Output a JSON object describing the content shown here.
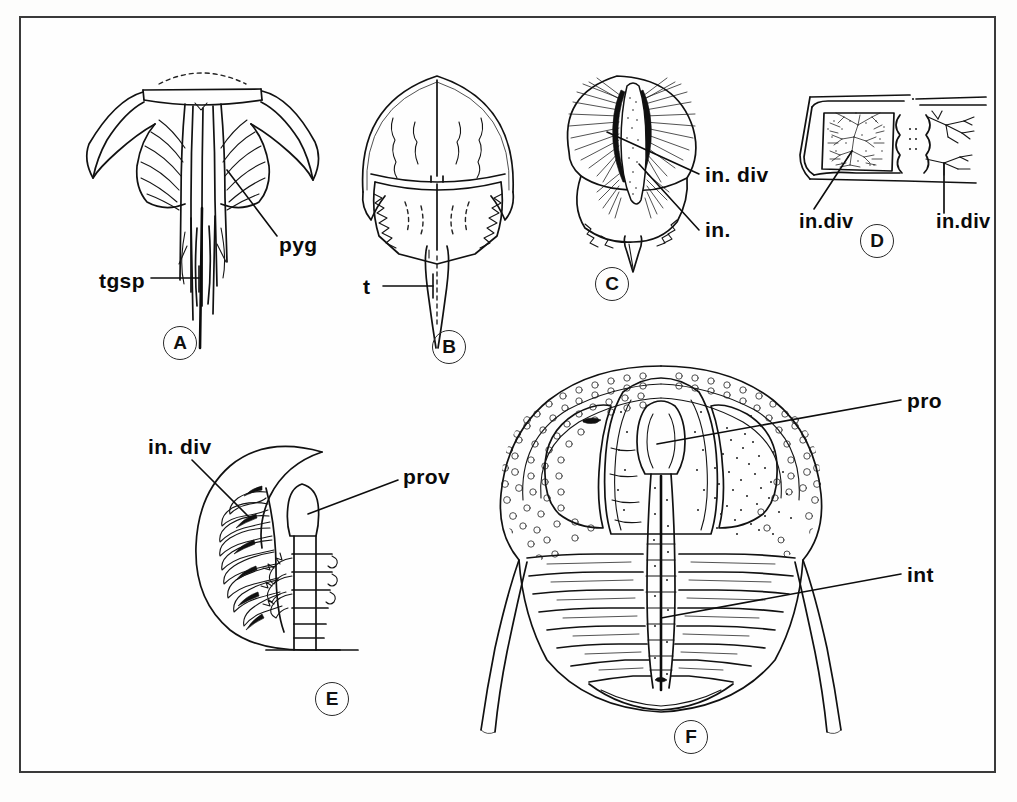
{
  "figure": {
    "background_color": "#fefefe",
    "line_color": "#111111",
    "frame_color": "#3a3a3a"
  },
  "panels": [
    {
      "id": "A",
      "tag": "A",
      "subject": "trilobite-pygidium-with-trailing-spines",
      "labels": [
        {
          "key": "pyg",
          "text": "pyg",
          "meaning": "pygidium"
        },
        {
          "key": "tgsp",
          "text": "tgsp",
          "meaning": "trailing genal spine"
        }
      ]
    },
    {
      "id": "B",
      "tag": "B",
      "subject": "horseshoe-crab-dorsal-view",
      "labels": [
        {
          "key": "t",
          "text": "t",
          "meaning": "telson"
        }
      ]
    },
    {
      "id": "C",
      "tag": "C",
      "subject": "digestive-diverticula-dorsal-view",
      "labels": [
        {
          "key": "in_div",
          "text": "in. div",
          "meaning": "intestinal diverticula"
        },
        {
          "key": "in",
          "text": "in.",
          "meaning": "intestine"
        }
      ]
    },
    {
      "id": "D",
      "tag": "D",
      "subject": "cross-section-branching-diverticula",
      "labels": [
        {
          "key": "in_div_left",
          "text": "in.div",
          "meaning": "intestinal diverticula"
        },
        {
          "key": "in_div_right",
          "text": "in.div",
          "meaning": "intestinal diverticula"
        }
      ]
    },
    {
      "id": "E",
      "tag": "E",
      "subject": "half-body-gut-and-proventriculus",
      "labels": [
        {
          "key": "in_div",
          "text": "in. div",
          "meaning": "intestinal diverticula"
        },
        {
          "key": "prov",
          "text": "prov",
          "meaning": "proventriculus"
        }
      ]
    },
    {
      "id": "F",
      "tag": "F",
      "subject": "large-stippled-trilobite-cephalon",
      "labels": [
        {
          "key": "pro",
          "text": "pro",
          "meaning": "proventriculus"
        },
        {
          "key": "int",
          "text": "int",
          "meaning": "intestine"
        }
      ]
    }
  ]
}
